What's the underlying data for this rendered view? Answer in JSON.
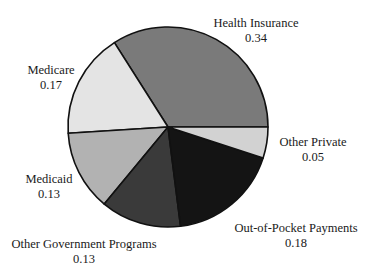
{
  "chart_data": {
    "type": "pie",
    "title": "",
    "categories": [
      "Health Insurance",
      "Medicare",
      "Medicaid",
      "Other Government Programs",
      "Out-of-Pocket Payments",
      "Other Private"
    ],
    "values": [
      0.34,
      0.17,
      0.13,
      0.13,
      0.18,
      0.05
    ],
    "value_labels": [
      "0.34",
      "0.17",
      "0.13",
      "0.13",
      "0.18",
      "0.05"
    ],
    "colors": [
      "#7a7a7a",
      "#e4e4e4",
      "#b2b2b2",
      "#3a3a3a",
      "#141414",
      "#d2d2d2"
    ],
    "start_angle_deg": 0,
    "direction": "counterclockwise",
    "legend": "none",
    "labels_position": "outside"
  },
  "labels": [
    {
      "name": "Health Insurance",
      "value": "0.34"
    },
    {
      "name": "Medicare",
      "value": "0.17"
    },
    {
      "name": "Medicaid",
      "value": "0.13"
    },
    {
      "name": "Other Government Programs",
      "value": "0.13"
    },
    {
      "name": "Out-of-Pocket Payments",
      "value": "0.18"
    },
    {
      "name": "Other Private",
      "value": "0.05"
    }
  ]
}
